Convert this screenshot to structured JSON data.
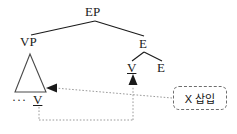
{
  "diagram": {
    "type": "syntactic-tree",
    "title": "",
    "nodes": {
      "root": "EP",
      "left_child": "VP",
      "right_child": "E",
      "right_grandchild_left": "V",
      "right_grandchild_right": "E",
      "left_terminal_ellipsis": "···",
      "left_terminal": "V"
    },
    "annotation_box": {
      "label": "X 삽입"
    },
    "colors": {
      "line": "#1a1a1a",
      "dotted": "#8a8a8a",
      "box_border": "#6d6d6d",
      "text": "#1a1a1a",
      "background": "#ffffff"
    },
    "arrows": [
      {
        "name": "movement-arrow-left",
        "direction": "left",
        "target": "VP-triangle"
      },
      {
        "name": "movement-arrow-up",
        "direction": "up",
        "target": "V-head"
      }
    ]
  }
}
